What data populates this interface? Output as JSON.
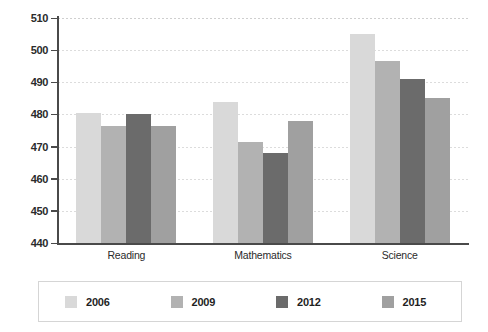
{
  "chart_data": {
    "type": "bar",
    "title": "",
    "subtitle": "",
    "xlabel": "",
    "ylabel": "",
    "categories": [
      "Reading",
      "Mathematics",
      "Science"
    ],
    "series": [
      {
        "name": "2006",
        "color": "#d9d9d9",
        "values": [
          480.5,
          484.0,
          505.0
        ]
      },
      {
        "name": "2009",
        "color": "#b2b2b2",
        "values": [
          476.5,
          471.5,
          496.5
        ]
      },
      {
        "name": "2012",
        "color": "#6b6b6b",
        "values": [
          480.0,
          468.0,
          491.0
        ]
      },
      {
        "name": "2015",
        "color": "#a0a0a0",
        "values": [
          476.5,
          478.0,
          485.0
        ]
      }
    ],
    "ylim": [
      440,
      510
    ],
    "yticks": [
      440,
      450,
      460,
      470,
      480,
      490,
      500,
      510
    ],
    "ytick_labels": [
      "440",
      "450",
      "460",
      "470",
      "480",
      "490",
      "500",
      "510"
    ],
    "grid": true,
    "legend_position": "bottom",
    "legend_entries": [
      "2006",
      "2009",
      "2012",
      "2015"
    ]
  },
  "axis": {
    "axis_color": "#4a4a4a",
    "grid_color": "#dcdcdc"
  }
}
